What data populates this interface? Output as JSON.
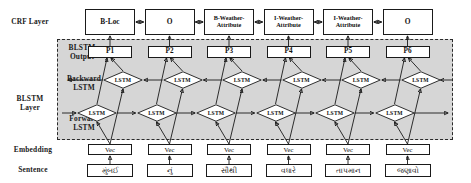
{
  "figure": {
    "colors": {
      "blstm_region_fill": "#d6d6d6",
      "stroke": "#1a1a1a",
      "box_fill": "#ffffff"
    }
  },
  "row_labels": {
    "crf": "CRF Layer",
    "blstm_output": "BLSTM\nOutput",
    "backward_lstm": "Backward\nLSTM",
    "blstm_layer": "BLSTM\nLayer",
    "forward_lstm": "Forward\nLSTM",
    "embedding": "Embedding",
    "sentence": "Sentence"
  },
  "columns": [
    {
      "crf_tag": "B-Loc",
      "prediction": "P1",
      "backward_lstm": "LSTM",
      "forward_lstm": "LSTM",
      "embedding": "Vec",
      "token": "મુંબઈ"
    },
    {
      "crf_tag": "O",
      "prediction": "P2",
      "backward_lstm": "LSTM",
      "forward_lstm": "LSTM",
      "embedding": "Vec",
      "token": "નું"
    },
    {
      "crf_tag": "B-Weather-Attribute",
      "prediction": "P3",
      "backward_lstm": "LSTM",
      "forward_lstm": "LSTM",
      "embedding": "Vec",
      "token": "સૌથી"
    },
    {
      "crf_tag": "I-Weather-Attribute",
      "prediction": "P4",
      "backward_lstm": "LSTM",
      "forward_lstm": "LSTM",
      "embedding": "Vec",
      "token": "વધારે"
    },
    {
      "crf_tag": "I-Weather-Attribute",
      "prediction": "P5",
      "backward_lstm": "LSTM",
      "forward_lstm": "LSTM",
      "embedding": "Vec",
      "token": "તાપમાન"
    },
    {
      "crf_tag": "O",
      "prediction": "P6",
      "backward_lstm": "LSTM",
      "forward_lstm": "LSTM",
      "embedding": "Vec",
      "token": "જણાવો"
    }
  ]
}
